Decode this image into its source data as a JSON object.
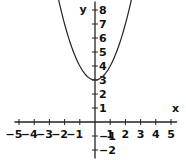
{
  "chart_data": {
    "type": "line",
    "title": "",
    "xlabel": "x",
    "ylabel": "y",
    "xlim": [
      -5.2,
      5.5
    ],
    "ylim": [
      -2.4,
      8.6
    ],
    "x_ticks": [
      -5,
      -4,
      -3,
      -2,
      -1,
      1,
      2,
      3,
      4,
      5
    ],
    "y_ticks": [
      -2,
      -1,
      1,
      2,
      3,
      4,
      5,
      6,
      7,
      8
    ],
    "grid": false,
    "series": [
      {
        "name": "y = x^2 + 3",
        "function": "x^2+3",
        "x": [
          -2.4,
          -2,
          -1,
          0,
          1,
          2,
          2.4
        ],
        "y": [
          8.76,
          7,
          4,
          3,
          4,
          7,
          8.76
        ]
      }
    ]
  },
  "labels": {
    "x_axis": "x",
    "y_axis": "y"
  }
}
